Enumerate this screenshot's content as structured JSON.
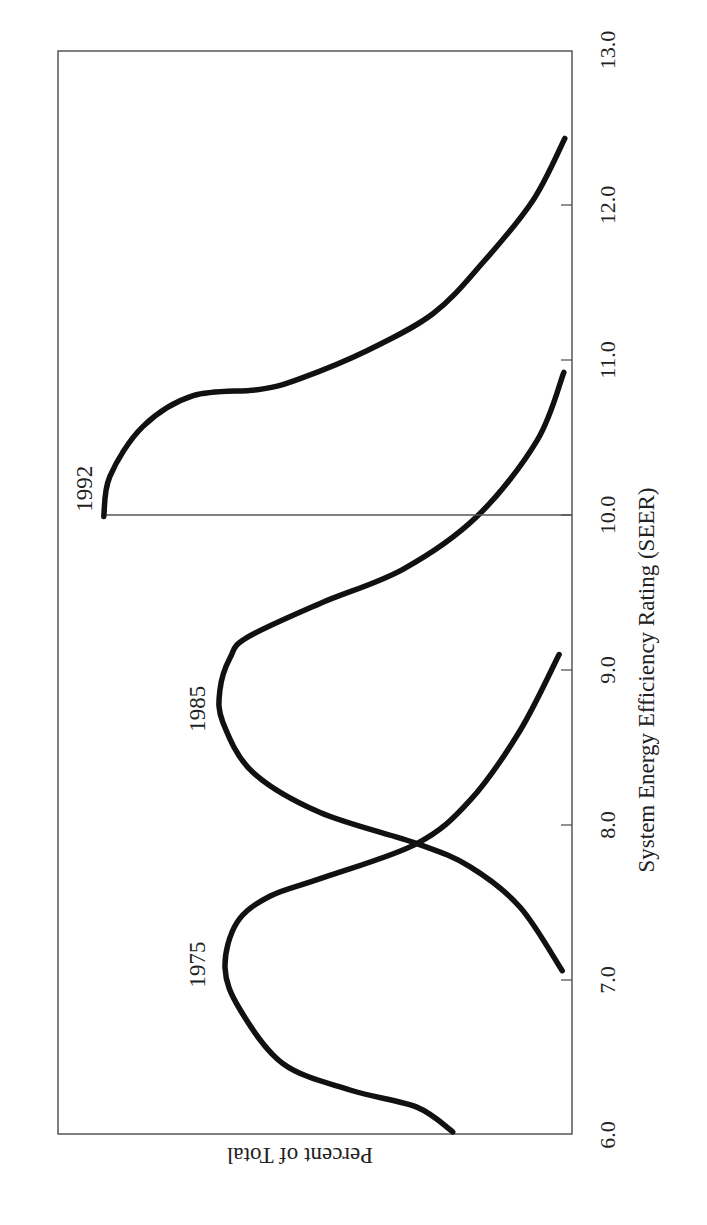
{
  "chart_data": {
    "type": "line",
    "orientation_note_visible": "figure rotated 90 degrees counter-clockwise",
    "xlabel": "System Energy Efficiency Rating (SEER)",
    "ylabel": "Percent of Total",
    "xlim": [
      6.0,
      13.0
    ],
    "ylim": [
      0,
      100
    ],
    "x_ticks": [
      "6.0",
      "7.0",
      "8.0",
      "9.0",
      "10.0",
      "11.0",
      "12.0",
      "13.0"
    ],
    "x_tick_values": [
      6,
      7,
      8,
      9,
      10,
      11,
      12,
      13
    ],
    "y_ticks": [],
    "grid": false,
    "legend": "none (direct curve labels)",
    "series": [
      {
        "name": "1975",
        "label_position": {
          "x": 7.1,
          "y": 73
        },
        "points": [
          [
            6.02,
            23.2
          ],
          [
            6.18,
            30.2
          ],
          [
            6.29,
            43.2
          ],
          [
            6.46,
            56.2
          ],
          [
            6.81,
            64.6
          ],
          [
            7.08,
            67.5
          ],
          [
            7.37,
            65.2
          ],
          [
            7.54,
            58.8
          ],
          [
            7.66,
            48.4
          ],
          [
            7.88,
            30.2
          ],
          [
            8.16,
            19.8
          ],
          [
            8.61,
            10.1
          ],
          [
            9.1,
            2.5
          ]
        ]
      },
      {
        "name": "1985",
        "label_position": {
          "x": 8.75,
          "y": 73
        },
        "points": [
          [
            7.06,
            1.9
          ],
          [
            7.47,
            10.1
          ],
          [
            7.73,
            19.8
          ],
          [
            7.88,
            30.2
          ],
          [
            8.08,
            49.0
          ],
          [
            8.34,
            62.1
          ],
          [
            8.66,
            67.9
          ],
          [
            8.87,
            68.5
          ],
          [
            9.08,
            66.5
          ],
          [
            9.21,
            63.2
          ],
          [
            9.43,
            49.0
          ],
          [
            9.65,
            32.9
          ],
          [
            9.99,
            18.5
          ],
          [
            10.48,
            6.8
          ],
          [
            10.92,
            1.6
          ]
        ]
      },
      {
        "name": "1992",
        "label_position": {
          "x": 10.17,
          "y": 95
        },
        "baseline_at": 10.0,
        "points": [
          [
            9.99,
            91.1
          ],
          [
            10.25,
            89.9
          ],
          [
            10.57,
            83.5
          ],
          [
            10.77,
            73.7
          ],
          [
            10.81,
            60.7
          ],
          [
            10.88,
            52.9
          ],
          [
            11.06,
            39.9
          ],
          [
            11.3,
            27.0
          ],
          [
            11.63,
            17.3
          ],
          [
            12.03,
            7.6
          ],
          [
            12.43,
            1.4
          ]
        ]
      }
    ]
  },
  "colors": {
    "curve": "#111111",
    "frame": "#555555",
    "text": "#222222"
  }
}
